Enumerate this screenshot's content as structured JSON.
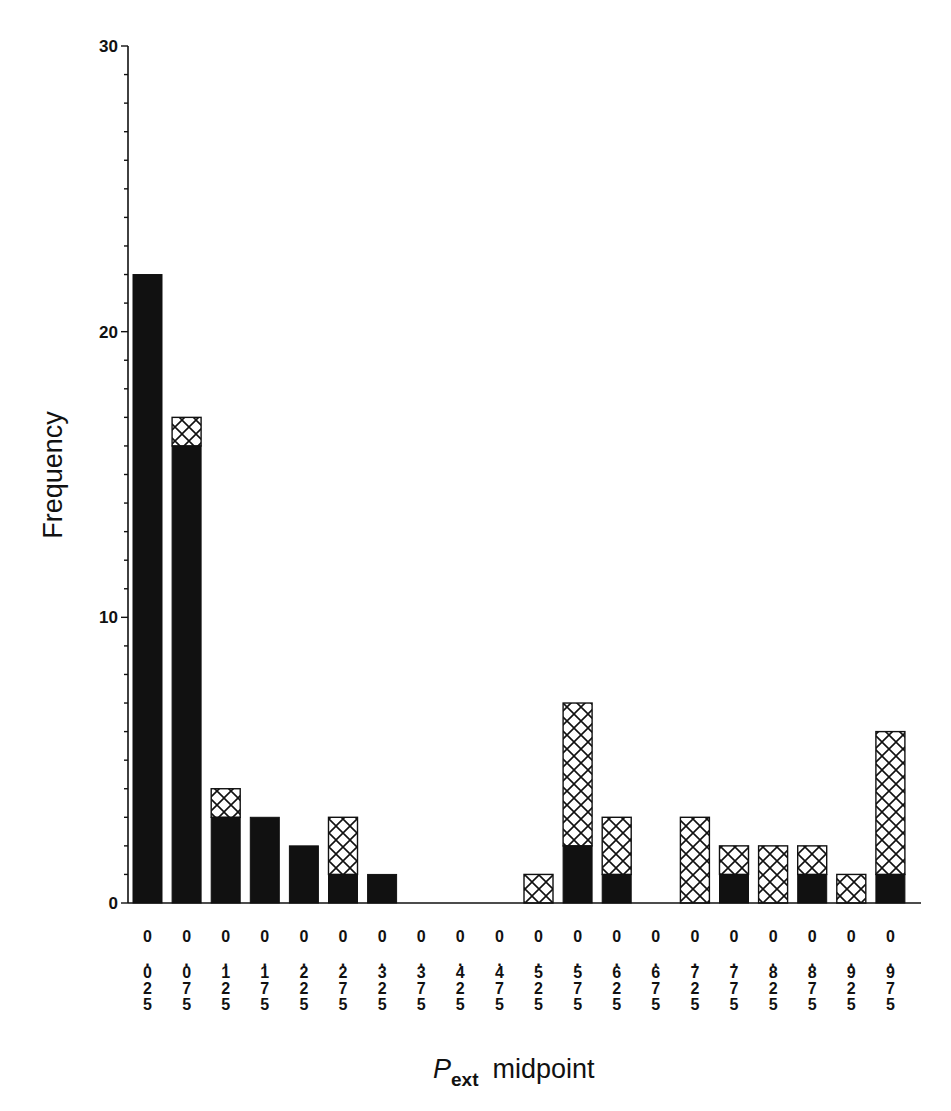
{
  "chart_data": {
    "type": "bar",
    "stacked": true,
    "title": "",
    "xlabel": "P_ext midpoint",
    "xlabel_parts": {
      "main": "P",
      "sub": "ext",
      "rest": "midpoint"
    },
    "ylabel": "Frequency",
    "ylim": [
      0,
      30
    ],
    "yticks": [
      0,
      10,
      20,
      30
    ],
    "yminor_step": 1,
    "grid": false,
    "legend": null,
    "categories": [
      "0.025",
      "0.075",
      "0.125",
      "0.175",
      "0.225",
      "0.275",
      "0.325",
      "0.375",
      "0.425",
      "0.475",
      "0.525",
      "0.575",
      "0.625",
      "0.675",
      "0.725",
      "0.775",
      "0.825",
      "0.875",
      "0.925",
      "0.975"
    ],
    "series": [
      {
        "name": "solid",
        "fill": "#111111",
        "values": [
          22,
          16,
          3,
          3,
          2,
          1,
          1,
          0,
          0,
          0,
          0,
          2,
          1,
          0,
          0,
          1,
          0,
          1,
          0,
          1
        ]
      },
      {
        "name": "cross-hatched",
        "fill": "cross-hatch",
        "values": [
          0,
          1,
          1,
          0,
          0,
          2,
          0,
          0,
          0,
          0,
          1,
          5,
          2,
          0,
          3,
          1,
          2,
          1,
          1,
          5
        ]
      }
    ],
    "totals": [
      22,
      17,
      4,
      3,
      2,
      3,
      1,
      0,
      0,
      0,
      1,
      7,
      3,
      0,
      3,
      2,
      2,
      2,
      1,
      6
    ]
  }
}
